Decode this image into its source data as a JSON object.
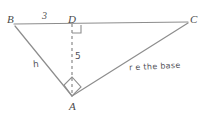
{
  "figure": {
    "kind": "geometry-diagram",
    "width": 207,
    "height": 116,
    "background_color": "#ffffff",
    "stroke_color": "#8a8a8a",
    "text_color": "#4a4a4a"
  },
  "vertices": {
    "B": {
      "label": "B",
      "x": 14,
      "y": 24
    },
    "C": {
      "label": "C",
      "x": 188,
      "y": 22
    },
    "A": {
      "label": "A",
      "x": 72,
      "y": 96
    },
    "D": {
      "label": "D",
      "x": 72,
      "y": 24
    }
  },
  "segments": [
    {
      "name": "base-line-BC",
      "from": "B",
      "to": "C",
      "style": "solid"
    },
    {
      "name": "leg-BA",
      "from": "B",
      "to": "A",
      "style": "solid"
    },
    {
      "name": "leg-AC",
      "from": "A",
      "to": "C",
      "style": "solid"
    },
    {
      "name": "altitude-DA",
      "from": "D",
      "to": "A",
      "style": "dashed"
    }
  ],
  "labels": {
    "segment_BD": "3",
    "altitude": "5",
    "leg_h": "h",
    "base_note": "r e the base"
  },
  "right_angle_marks": [
    {
      "name": "right-angle-at-D",
      "at": "D"
    },
    {
      "name": "right-angle-at-A",
      "at": "A"
    }
  ]
}
